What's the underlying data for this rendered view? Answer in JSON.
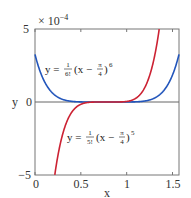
{
  "chart_data": {
    "type": "line",
    "title": "",
    "xlabel": "x",
    "ylabel": "y",
    "xlim": [
      0,
      1.5708
    ],
    "ylim": [
      -0.0005,
      0.0005
    ],
    "y_scale_label": "× 10",
    "y_scale_exp": "−4",
    "xticks": [
      "0",
      "0.5",
      "1",
      "1.5"
    ],
    "xtick_values": [
      0,
      0.5,
      1,
      1.5
    ],
    "yticks": [
      "−5",
      "0",
      "5"
    ],
    "ytick_values": [
      -0.0005,
      0,
      0.0005
    ],
    "grid": false,
    "legend": "none",
    "series": [
      {
        "name": "y = 1/6! (x − π/4)^6",
        "color": "#2255bb",
        "formula": "(x - pi/4)^6 / 720",
        "x": [
          0,
          0.1,
          0.2,
          0.3,
          0.4,
          0.5,
          0.6,
          0.7,
          0.785,
          0.9,
          1.0,
          1.1,
          1.2,
          1.3,
          1.4,
          1.5,
          1.5708
        ],
        "values": [
          0.000328,
          0.000141,
          5.52e-05,
          1.93e-05,
          5.68e-06,
          1.36e-06,
          2.3e-07,
          0.0,
          0.0,
          0.0,
          1.4e-07,
          1.32e-06,
          6.99e-06,
          2.63e-05,
          7.91e-05,
          0.000204,
          0.000328
        ]
      },
      {
        "name": "y = 1/5! (x − π/4)^5",
        "color": "#cc2233",
        "formula": "(x - pi/4)^5 / 120",
        "x": [
          0.19,
          0.3,
          0.4,
          0.5,
          0.6,
          0.7,
          0.785,
          0.9,
          1.0,
          1.1,
          1.2,
          1.3,
          1.33
        ],
        "values": [
          -0.000627,
          -0.000227,
          -7.1e-05,
          -1.56e-05,
          -1.83e-06,
          -4e-08,
          0.0,
          1.6e-07,
          3.86e-06,
          2.51e-05,
          9.89e-05,
          0.000293,
          0.000376
        ]
      }
    ],
    "annotations": [
      {
        "text_main": "y = ",
        "frac_num": "1",
        "frac_den": "6!",
        "mid": "(x − ",
        "pi_num": "π",
        "pi_den": "4",
        "close": ")",
        "exp": "6"
      },
      {
        "text_main": "y = ",
        "frac_num": "1",
        "frac_den": "5!",
        "mid": "(x − ",
        "pi_num": "π",
        "pi_den": "4",
        "close": ")",
        "exp": "5"
      }
    ]
  }
}
